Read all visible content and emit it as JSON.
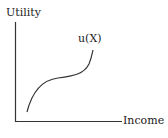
{
  "diagram": {
    "title": "",
    "y_axis_label": "Utility",
    "x_axis_label": "Income",
    "curve_label": "u(X)",
    "colors": {
      "axis": "#333333",
      "curve": "#333333",
      "text": "#1a1a1a",
      "background": "#ffffff"
    },
    "curve_shape": "S-shaped utility function: concave at low income, flattening, then convex (rising) at higher income"
  }
}
